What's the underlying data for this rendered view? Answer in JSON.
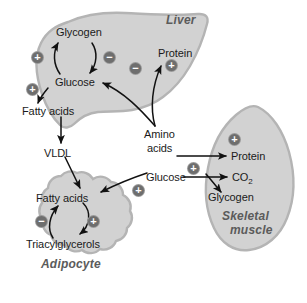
{
  "diagram": {
    "organs": [
      {
        "id": "liver",
        "name": "Liver"
      },
      {
        "id": "adipocyte",
        "name": "Adipocyte"
      },
      {
        "id": "muscle",
        "name_line1": "Skeletal",
        "name_line2": "muscle"
      }
    ],
    "metabolites": {
      "liver": [
        {
          "id": "glycogen",
          "label": "Glycogen"
        },
        {
          "id": "glucose",
          "label": "Glucose"
        },
        {
          "id": "fatty_acids",
          "label": "Fatty acids"
        },
        {
          "id": "protein",
          "label": "Protein"
        }
      ],
      "transport": [
        {
          "id": "vldl",
          "label": "VLDL"
        },
        {
          "id": "amino_acids_l1",
          "label": "Amino"
        },
        {
          "id": "amino_acids_l2",
          "label": "acids"
        },
        {
          "id": "glucose_blood",
          "label": "Glucose"
        }
      ],
      "adipocyte": [
        {
          "id": "adip_fatty_acids",
          "label": "Fatty acids"
        },
        {
          "id": "triacylglycerols",
          "label": "Triacylglycerols"
        }
      ],
      "muscle": [
        {
          "id": "m_protein",
          "label": "Protein"
        },
        {
          "id": "m_co2",
          "label": "CO",
          "subscript": "2"
        },
        {
          "id": "m_glycogen",
          "label": "Glycogen"
        }
      ]
    },
    "regulators": [
      {
        "id": "reg-glycogen-synthesis",
        "sign": "+",
        "target": "Glucose to Glycogen (liver)"
      },
      {
        "id": "reg-glycogenolysis",
        "sign": "−",
        "target": "Glycogen to Glucose (liver)"
      },
      {
        "id": "reg-lipogenesis-liver",
        "sign": "+",
        "target": "Glucose to Fatty acids (liver)"
      },
      {
        "id": "reg-gluconeogenesis",
        "sign": "−",
        "target": "Amino acids to Glucose (liver)"
      },
      {
        "id": "reg-protein-synthesis-liver",
        "sign": "+",
        "target": "Amino acids to Protein (liver)"
      },
      {
        "id": "reg-fa-uptake-adipocyte",
        "sign": "+",
        "target": "Glucose to Fatty acids (adipocyte)"
      },
      {
        "id": "reg-lipolysis",
        "sign": "−",
        "target": "Triacylglycerols to Fatty acids"
      },
      {
        "id": "reg-esterification",
        "sign": "+",
        "target": "Fatty acids to Triacylglycerols"
      },
      {
        "id": "reg-protein-synthesis-muscle",
        "sign": "+",
        "target": "Amino acids to Protein (muscle)"
      },
      {
        "id": "reg-glucose-uptake-muscle",
        "sign": "+",
        "target": "Glucose uptake (muscle)"
      }
    ],
    "colors": {
      "organ_fill": "#d2d2d2",
      "organ_edge": "#b4b4b4",
      "organ_label": "#5b5b5b",
      "badge_fill": "#6e6e6e",
      "arrow": "#111111",
      "text": "#1a1a1a",
      "background": "#ffffff"
    }
  }
}
